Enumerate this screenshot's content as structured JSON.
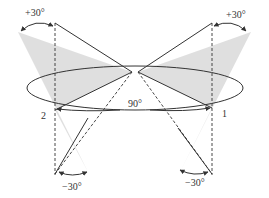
{
  "labels": {
    "top_left_angle": "+30°",
    "top_right_angle": "+30°",
    "bottom_left_angle": "−30°",
    "bottom_right_angle": "−30°",
    "center_angle": "90°",
    "point_left": "2",
    "point_right": "1"
  },
  "colors": {
    "line": "#333333",
    "shade": "#d9d9d9",
    "background": "#ffffff"
  }
}
